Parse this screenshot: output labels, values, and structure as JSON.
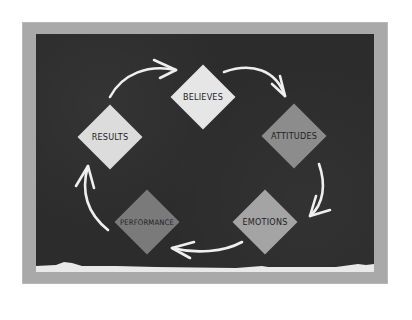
{
  "diagram": {
    "title": "",
    "cycle_direction": "clockwise",
    "nodes": [
      {
        "id": "believes",
        "label": "BELIEVES",
        "color": "#e6e6e6"
      },
      {
        "id": "attitudes",
        "label": "ATTITUDES",
        "color": "#8c8c8c"
      },
      {
        "id": "emotions",
        "label": "EMOTIONS",
        "color": "#a4a4a4"
      },
      {
        "id": "performance",
        "label": "PERFORMANCE",
        "color": "#7a7a7a"
      },
      {
        "id": "results",
        "label": "RESULTS",
        "color": "#dcdcdc"
      }
    ],
    "edges": [
      {
        "from": "results",
        "to": "believes"
      },
      {
        "from": "believes",
        "to": "attitudes"
      },
      {
        "from": "attitudes",
        "to": "emotions"
      },
      {
        "from": "emotions",
        "to": "performance"
      },
      {
        "from": "performance",
        "to": "results"
      }
    ]
  },
  "colors": {
    "page_background": "#ffffff",
    "frame": "#a9a9a9",
    "board": "#2c2c2c",
    "chalk": "#f2f2f2"
  }
}
